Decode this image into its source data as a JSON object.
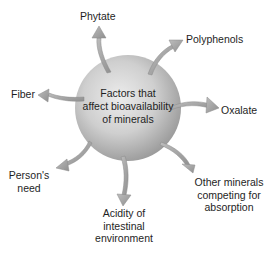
{
  "center": {
    "lines": [
      "Factors that",
      "affect bioavailability",
      "of minerals"
    ]
  },
  "factors": [
    {
      "id": "phytate",
      "lines": [
        "Phytate"
      ]
    },
    {
      "id": "polyphenols",
      "lines": [
        "Polyphenols"
      ]
    },
    {
      "id": "oxalate",
      "lines": [
        "Oxalate"
      ]
    },
    {
      "id": "other-minerals",
      "lines": [
        "Other minerals",
        "competing for",
        "absorption"
      ]
    },
    {
      "id": "acidity",
      "lines": [
        "Acidity of",
        "intestinal",
        "environment"
      ]
    },
    {
      "id": "persons-need",
      "lines": [
        "Person's",
        "need"
      ]
    },
    {
      "id": "fiber",
      "lines": [
        "Fiber"
      ]
    }
  ],
  "colors": {
    "sphere_light": "#e6e6e6",
    "sphere_dark": "#9a9a9a",
    "arrow_fill": "#a8a8a8",
    "arrow_stroke": "#8a8a8a",
    "text": "#1e1e1e"
  }
}
